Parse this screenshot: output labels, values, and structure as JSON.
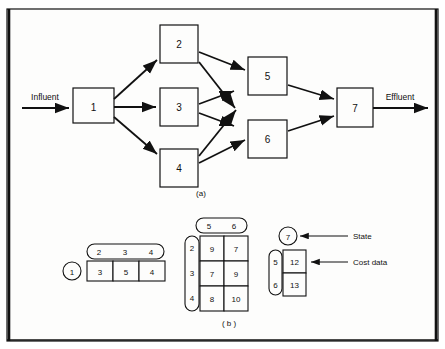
{
  "figure": {
    "background": "#fdfdfc",
    "stroke": "#111111",
    "panel_a_label": "(a)",
    "panel_b_label": "( b )"
  },
  "panel_a": {
    "inlet_label": "Influent",
    "outlet_label": "Effluent",
    "nodes": [
      {
        "id": "1",
        "label": "1",
        "x": 73,
        "y": 88,
        "w": 41,
        "h": 35
      },
      {
        "id": "2",
        "label": "2",
        "x": 160,
        "y": 25,
        "w": 38,
        "h": 38
      },
      {
        "id": "3",
        "label": "3",
        "x": 160,
        "y": 88,
        "w": 38,
        "h": 38
      },
      {
        "id": "4",
        "label": "4",
        "x": 160,
        "y": 149,
        "w": 38,
        "h": 38
      },
      {
        "id": "5",
        "label": "5",
        "x": 248,
        "y": 57,
        "w": 39,
        "h": 38
      },
      {
        "id": "6",
        "label": "6",
        "x": 248,
        "y": 120,
        "w": 39,
        "h": 38
      },
      {
        "id": "7",
        "label": "7",
        "x": 337,
        "y": 88,
        "w": 36,
        "h": 39
      }
    ],
    "edges": [
      {
        "from": "influent",
        "to": "1"
      },
      {
        "from": "1",
        "to": "2"
      },
      {
        "from": "1",
        "to": "3"
      },
      {
        "from": "1",
        "to": "4"
      },
      {
        "from": "2",
        "to": "5"
      },
      {
        "from": "2",
        "to": "6"
      },
      {
        "from": "3",
        "to": "5"
      },
      {
        "from": "3",
        "to": "6"
      },
      {
        "from": "4",
        "to": "5"
      },
      {
        "from": "4",
        "to": "6"
      },
      {
        "from": "5",
        "to": "7"
      },
      {
        "from": "6",
        "to": "7"
      },
      {
        "from": "7",
        "to": "effluent"
      }
    ]
  },
  "panel_b": {
    "annotations": {
      "state_label": "State",
      "cost_label": "Cost data"
    },
    "table1": {
      "row_state": "1",
      "column_headers": [
        "2",
        "3",
        "4"
      ],
      "values": [
        3,
        5,
        4
      ]
    },
    "table2": {
      "column_headers": [
        "5",
        "6"
      ],
      "row_headers": [
        "2",
        "3",
        "4"
      ],
      "values": [
        [
          9,
          7
        ],
        [
          7,
          9
        ],
        [
          8,
          10
        ]
      ]
    },
    "table3": {
      "state": "7",
      "row_headers": [
        "5",
        "6"
      ],
      "values": [
        12,
        13
      ]
    }
  }
}
